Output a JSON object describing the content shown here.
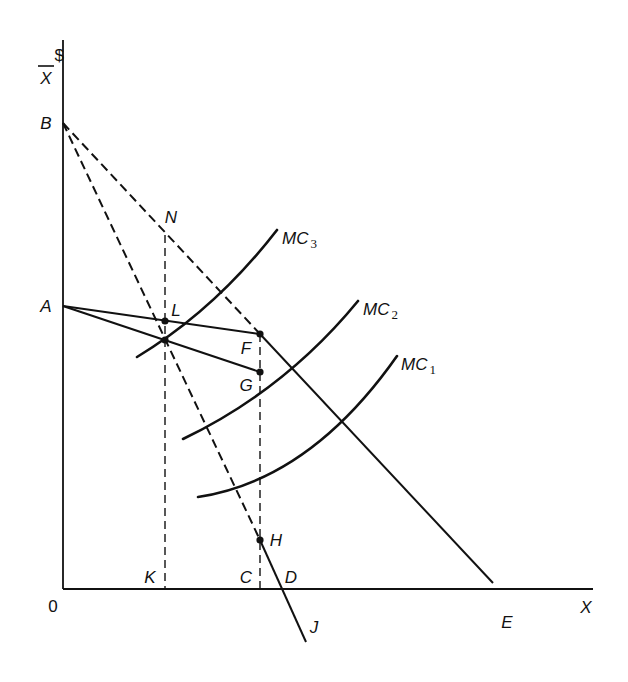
{
  "diagram": {
    "axes": {
      "y_label_top": "$",
      "y_label_bottom": "X",
      "x_label": "X",
      "origin_label": "0"
    },
    "points": {
      "A": "A",
      "B": "B",
      "C": "C",
      "D": "D",
      "E": "E",
      "F": "F",
      "G": "G",
      "H": "H",
      "J": "J",
      "K": "K",
      "L": "L",
      "N": "N"
    },
    "curves": [
      {
        "name": "MC",
        "subscript": "3"
      },
      {
        "name": "MC",
        "subscript": "2"
      },
      {
        "name": "MC",
        "subscript": "1"
      }
    ],
    "colors": {
      "ink": "#111111",
      "background": "#ffffff"
    }
  }
}
